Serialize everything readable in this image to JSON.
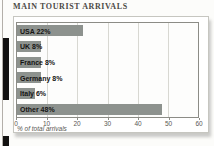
{
  "title": "MAIN TOURIST ARRIVALS",
  "colors": {
    "bar": "#8d928e",
    "grid": "#d8d8d2",
    "plot_border": "#8c8c86",
    "panel_border": "#c6c6c0",
    "title_text": "#4c4a46",
    "axis_text": "#5a5853",
    "bar_label_text": "#151413",
    "spine_mark": "#121110"
  },
  "chart_data": {
    "type": "bar",
    "orientation": "horizontal",
    "title": "MAIN TOURIST ARRIVALS",
    "categories": [
      "USA",
      "UK",
      "France",
      "Germany",
      "Italy",
      "Other"
    ],
    "values": [
      22,
      8,
      8,
      8,
      6,
      48
    ],
    "bar_labels": [
      "USA 22%",
      "UK 8%",
      "France 8%",
      "Germany 8%",
      "Italy 6%",
      "Other 48%"
    ],
    "xlabel": "% of total arrivals",
    "xlim": [
      0,
      60
    ],
    "xticks": [
      0,
      10,
      20,
      30,
      40,
      50,
      60
    ],
    "grid": "vertical",
    "legend": "none"
  }
}
